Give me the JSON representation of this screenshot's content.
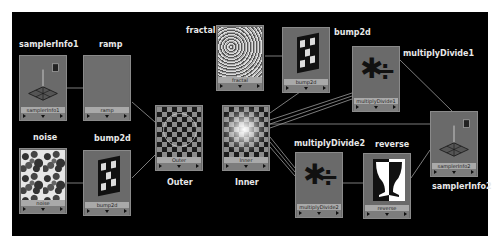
{
  "graph": {
    "background": "#000000",
    "node_color": "#6a6a6a",
    "nodes": {
      "samplerInfo1": {
        "title": "samplerInfo1",
        "bar": "samplerInfo1"
      },
      "ramp": {
        "title": "ramp",
        "bar": "ramp"
      },
      "noise": {
        "title": "noise",
        "bar": "noise"
      },
      "bump2d_bottom": {
        "title": "bump2d",
        "bar": "bump2d"
      },
      "outer": {
        "title": "Outer",
        "bar": "Outer"
      },
      "inner": {
        "title": "Inner",
        "bar": "Inner"
      },
      "fractal": {
        "title": "fractal",
        "bar": "fractal"
      },
      "bump2d_top": {
        "title": "bump2d",
        "bar": "bump2d"
      },
      "multiplyDivide1": {
        "title": "multiplyDivide1",
        "bar": "multiplyDivide1"
      },
      "samplerInfo2": {
        "title": "samplerInfo2",
        "bar": "samplerInfo2"
      },
      "multiplyDivide2": {
        "title": "multiplyDivide2",
        "bar": "multiplyDivide2"
      },
      "reverse": {
        "title": "reverse",
        "bar": "reverse"
      }
    },
    "connections": [
      {
        "from": "samplerInfo1",
        "to": "ramp"
      },
      {
        "from": "ramp",
        "to": "outer"
      },
      {
        "from": "noise",
        "to": "bump2d_bottom"
      },
      {
        "from": "bump2d_bottom",
        "to": "outer"
      },
      {
        "from": "fractal",
        "to": "bump2d_top"
      },
      {
        "from": "bump2d_top",
        "to": "inner"
      },
      {
        "from": "multiplyDivide1",
        "to": "inner"
      },
      {
        "from": "samplerInfo2",
        "to": "multiplyDivide1"
      },
      {
        "from": "samplerInfo2",
        "to": "inner"
      },
      {
        "from": "multiplyDivide2",
        "to": "inner"
      },
      {
        "from": "reverse",
        "to": "multiplyDivide2"
      },
      {
        "from": "samplerInfo2",
        "to": "reverse"
      }
    ]
  }
}
